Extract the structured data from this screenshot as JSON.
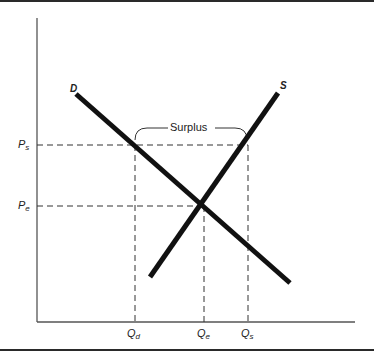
{
  "diagram": {
    "curves": [
      {
        "name": "D",
        "label": "D",
        "type": "demand",
        "from": [
          76,
          94
        ],
        "to": [
          290,
          283
        ]
      },
      {
        "name": "S",
        "label": "S",
        "type": "supply",
        "from": [
          150,
          277
        ],
        "to": [
          278,
          93
        ]
      }
    ],
    "axes": {
      "origin": [
        37,
        322
      ],
      "y_top": 18,
      "x_right": 355
    },
    "price_levels": [
      {
        "label": "P",
        "sub": "s",
        "y": 145
      },
      {
        "label": "P",
        "sub": "e",
        "y": 206
      }
    ],
    "quantity_levels": [
      {
        "label": "Q",
        "sub": "d",
        "x": 135
      },
      {
        "label": "Q",
        "sub": "e",
        "x": 204
      },
      {
        "label": "Q",
        "sub": "s",
        "x": 248
      }
    ],
    "equilibrium": [
      203,
      206
    ],
    "bracket": {
      "label": "Surplus",
      "x1": 135,
      "x2": 247,
      "y": 128
    }
  }
}
